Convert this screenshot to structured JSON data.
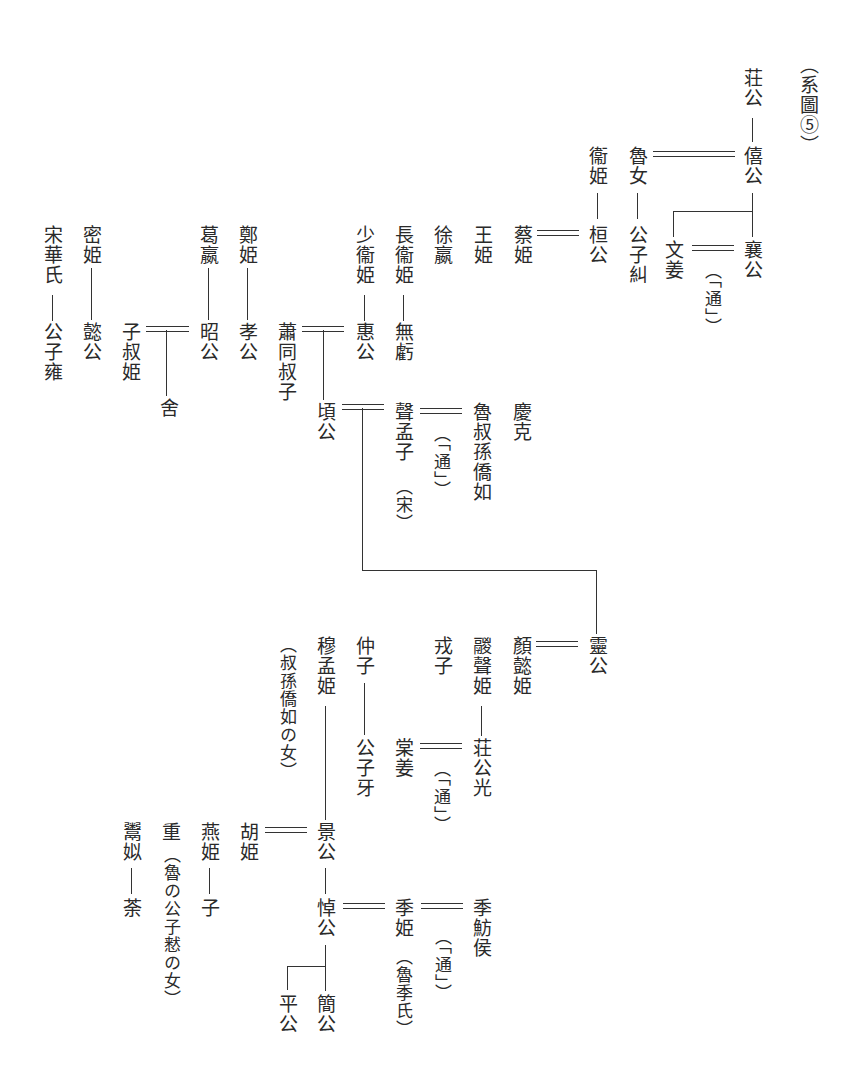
{
  "figure": {
    "label": "（系圖⑤）",
    "type": "vertical genealogy chart (Lu ruling house and consorts)"
  },
  "people": {
    "zhuang_gong": "荘公",
    "xi_gong": "僖公",
    "lu_nu": "魯女",
    "gongzi_jiu": "公子糾",
    "wei_ji": "衞姫",
    "huan_gong": "桓公",
    "cai_ji": "蔡姫",
    "wen_jiang": "文姜",
    "xiang_gong": "襄公",
    "tong_1": "（「通」）",
    "wang_ji": "王姫",
    "xu_ying": "徐嬴",
    "chang_wei_ji": "長衞姫",
    "wu_kui": "無虧",
    "shao_wei_ji": "少衞姫",
    "hui_gong": "惠公",
    "xiao_tong_shuzi": "蕭同叔子",
    "qing_gong": "頃公",
    "zheng_ji": "鄭姫",
    "xiao_gong": "孝公",
    "ge_ying": "葛嬴",
    "zhao_gong": "昭公",
    "zishu_ji": "子叔姫",
    "she": "舍",
    "mi_ji": "密姫",
    "yi_gong": "懿公",
    "song_hua_shi": "宋華氏",
    "gongzi_yong": "公子雍",
    "sheng_mengzi": "聲孟子",
    "song_note": "（宋）",
    "tong_2": "（「通」）",
    "lu_shusun_qiaoru": "魯叔孫僑如",
    "qing_ke": "慶克",
    "ling_gong": "靈公",
    "yan_yi_ji": "顏懿姫",
    "zong_sheng_ji": "鬷聲姫",
    "zhuang_gong_guang": "荘公光",
    "rong_zi": "戎子",
    "tang_jiang": "棠姜",
    "tong_3": "（「通」）",
    "zhong_zi": "仲子",
    "gongzi_ya": "公子牙",
    "mu_meng_ji": "穆孟姫",
    "mu_meng_ji_note": "（叔孫僑如の女）",
    "jing_gong": "景公",
    "hu_ji": "胡姫",
    "yan_ji": "燕姫",
    "zi": "子",
    "zhong": "重",
    "zhong_note": "（魯の公子慭の女）",
    "yu_si": "鬻姒",
    "tu": "荼",
    "dao_gong": "悼公",
    "ji_ji": "季姫",
    "ji_ji_note": "（魯季氏）",
    "tong_4": "（「通」）",
    "ji_fanghou": "季魴侯",
    "jian_gong": "簡公",
    "ping_gong": "平公"
  }
}
